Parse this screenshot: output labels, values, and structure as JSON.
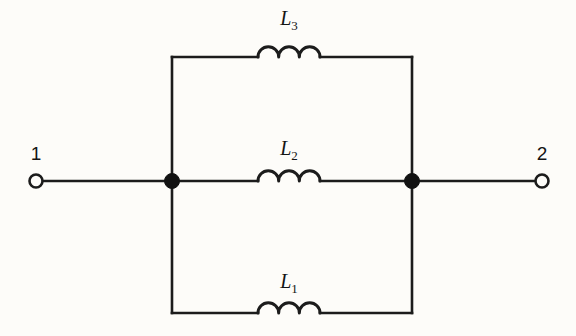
{
  "diagram": {
    "type": "electrical-schematic",
    "background_color": "#fdfcf9",
    "line_color": "#1c1c1c"
  },
  "terminals": [
    {
      "id": "terminal-1",
      "label": "1",
      "x": 36,
      "y": 181,
      "label_x": 36,
      "label_y": 160,
      "radius": 6.5,
      "style": "open-circle"
    },
    {
      "id": "terminal-2",
      "label": "2",
      "x": 542,
      "y": 181,
      "label_x": 542,
      "label_y": 160,
      "radius": 6.5,
      "style": "open-circle"
    }
  ],
  "nodes": [
    {
      "id": "node-left",
      "x": 172,
      "y": 181,
      "radius": 7.5,
      "style": "filled-dot"
    },
    {
      "id": "node-right",
      "x": 412,
      "y": 181,
      "radius": 7.5,
      "style": "filled-dot"
    }
  ],
  "rails": {
    "left_x": 172,
    "right_x": 412,
    "top_y": 57,
    "middle_y": 181,
    "bottom_y": 313
  },
  "components": [
    {
      "id": "inductor-l3",
      "symbol": "inductor",
      "name": "L",
      "subscript": "3",
      "branch": "top",
      "coil_start_x": 258,
      "coil_end_x": 320,
      "humps": 3,
      "wire_y": 57,
      "label_x": 289,
      "label_y": 25
    },
    {
      "id": "inductor-l2",
      "symbol": "inductor",
      "name": "L",
      "subscript": "2",
      "branch": "middle",
      "coil_start_x": 258,
      "coil_end_x": 320,
      "humps": 3,
      "wire_y": 181,
      "label_x": 289,
      "label_y": 155
    },
    {
      "id": "inductor-l1",
      "symbol": "inductor",
      "name": "L",
      "subscript": "1",
      "branch": "bottom",
      "coil_start_x": 258,
      "coil_end_x": 320,
      "humps": 3,
      "wire_y": 313,
      "label_x": 289,
      "label_y": 288
    }
  ]
}
